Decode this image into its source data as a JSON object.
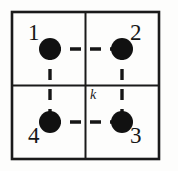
{
  "figure": {
    "caption": "",
    "background_color": "#fdfdfc",
    "ink_color": "#161616"
  },
  "frame": {
    "name": "outer-square",
    "x": 12,
    "y": 12,
    "width": 147,
    "height": 147,
    "stroke_width": 2.6,
    "color": "#1a1a1a"
  },
  "grid": {
    "vertical_divider_x": 85.5,
    "horizontal_divider_y": 85.5,
    "stroke_width": 2.0,
    "color": "#1a1a1a",
    "cells": 4
  },
  "nodes": [
    {
      "id": "n1",
      "label": "1",
      "x": 50,
      "y": 49,
      "radius": 11,
      "color": "#111111",
      "label_position": "upper-left"
    },
    {
      "id": "n2",
      "label": "2",
      "x": 122,
      "y": 49,
      "radius": 11,
      "color": "#111111",
      "label_position": "upper-right"
    },
    {
      "id": "n3",
      "label": "3",
      "x": 122,
      "y": 122,
      "radius": 11,
      "color": "#111111",
      "label_position": "lower-right"
    },
    {
      "id": "n4",
      "label": "4",
      "x": 50,
      "y": 122,
      "radius": 11,
      "color": "#111111",
      "label_position": "lower-left"
    }
  ],
  "edges": [
    {
      "id": "e12",
      "from": "n1",
      "to": "n2",
      "style": "dashed",
      "x1": 50,
      "y1": 49,
      "x2": 122,
      "y2": 49,
      "dash_pattern": "11 9",
      "stroke_width": 3.4,
      "color": "#161616"
    },
    {
      "id": "e43",
      "from": "n4",
      "to": "n3",
      "style": "dashed",
      "x1": 50,
      "y1": 122,
      "x2": 122,
      "y2": 122,
      "dash_pattern": "11 9",
      "stroke_width": 3.4,
      "color": "#161616"
    },
    {
      "id": "e14",
      "from": "n1",
      "to": "n4",
      "style": "dashed",
      "x1": 50,
      "y1": 49,
      "x2": 50,
      "y2": 122,
      "dash_pattern": "11 9",
      "stroke_width": 3.4,
      "color": "#161616"
    },
    {
      "id": "e23",
      "from": "n2",
      "to": "n3",
      "style": "dashed",
      "x1": 122,
      "y1": 49,
      "x2": 122,
      "y2": 122,
      "dash_pattern": "11 9",
      "stroke_width": 3.4,
      "color": "#161616"
    }
  ],
  "annotations": [
    {
      "id": "k",
      "text": "k",
      "style": "italic",
      "x": 90,
      "y": 88,
      "describes": "coupling-constant-label"
    }
  ]
}
